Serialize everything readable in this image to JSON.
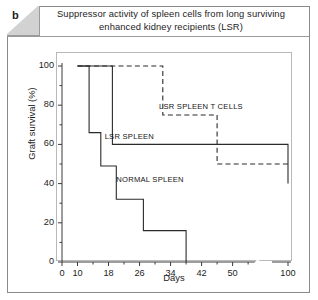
{
  "panel": {
    "letter": "b",
    "title": "Suppressor activity of spleen cells from long surviving enhanced kidney recipients (LSR)"
  },
  "chart_data": {
    "type": "line",
    "title": "Suppressor activity of spleen cells from long surviving enhanced kidney recipients (LSR)",
    "xlabel": "Days",
    "ylabel": "Graft survival (%)",
    "xlim": [
      0,
      100
    ],
    "ylim": [
      0,
      100
    ],
    "grid": false,
    "legend_position": "inline-annotations",
    "axis_break": {
      "after": 55,
      "before": 100
    },
    "xticks": [
      0,
      10,
      18,
      26,
      34,
      42,
      50,
      100
    ],
    "xtick_labels": [
      "0",
      "10",
      "18",
      "26",
      "34",
      "42",
      "50",
      "100"
    ],
    "yticks": [
      0,
      20,
      40,
      60,
      80,
      100
    ],
    "ytick_labels": [
      "0",
      "20",
      "40",
      "60",
      "80",
      "100"
    ],
    "series": [
      {
        "name": "LSR SPLEEN T CELLS",
        "style": "dashed",
        "label_x": 31,
        "label_y": 79,
        "points": [
          {
            "x": 10,
            "y": 100
          },
          {
            "x": 32,
            "y": 100
          },
          {
            "x": 32,
            "y": 75
          },
          {
            "x": 46,
            "y": 75
          },
          {
            "x": 46,
            "y": 50
          },
          {
            "x": 100,
            "y": 50
          }
        ]
      },
      {
        "name": "LSR SPLEEN",
        "style": "solid",
        "label_x": 17,
        "label_y": 64,
        "points": [
          {
            "x": 10,
            "y": 100
          },
          {
            "x": 19,
            "y": 100
          },
          {
            "x": 19,
            "y": 60
          },
          {
            "x": 56,
            "y": 60
          },
          {
            "x": 56,
            "y": 40
          },
          {
            "x": 100,
            "y": 40
          }
        ]
      },
      {
        "name": "NORMAL SPLEEN",
        "style": "solid",
        "label_x": 20,
        "label_y": 42,
        "points": [
          {
            "x": 10,
            "y": 100
          },
          {
            "x": 13,
            "y": 100
          },
          {
            "x": 13,
            "y": 66
          },
          {
            "x": 16,
            "y": 66
          },
          {
            "x": 16,
            "y": 49
          },
          {
            "x": 20,
            "y": 49
          },
          {
            "x": 20,
            "y": 32
          },
          {
            "x": 27,
            "y": 32
          },
          {
            "x": 27,
            "y": 16
          },
          {
            "x": 38,
            "y": 16
          },
          {
            "x": 38,
            "y": 0
          }
        ]
      }
    ]
  }
}
